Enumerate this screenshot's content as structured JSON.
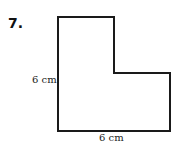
{
  "problem": {
    "number": "7.",
    "shape": "L-shaped polygon",
    "labels": {
      "left_side": "6 cm",
      "bottom_side": "6 cm"
    }
  }
}
